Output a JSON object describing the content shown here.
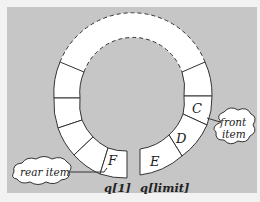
{
  "diagram": {
    "background_color": "#c6c6c6",
    "cell_fill": "#ffffff",
    "stroke_color": "#333333",
    "cells": [
      {
        "label": "C",
        "role": "front"
      },
      {
        "label": "D",
        "role": "item"
      },
      {
        "label": "E",
        "role": "item"
      },
      {
        "label": "F",
        "role": "rear"
      },
      {
        "label": "",
        "role": "empty"
      },
      {
        "label": "",
        "role": "empty"
      },
      {
        "label": "",
        "role": "empty"
      },
      {
        "label": "",
        "role": "empty"
      }
    ],
    "callouts": {
      "front": {
        "line1": "front",
        "line2": "item"
      },
      "rear": {
        "line1": "rear item"
      }
    },
    "index_labels": {
      "left": "q[1]",
      "right": "q[limit]"
    },
    "unused_arc": "dashed"
  }
}
